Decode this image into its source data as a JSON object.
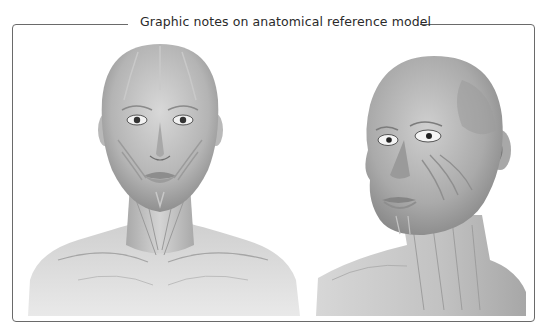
{
  "header": {
    "title": "Graphic notes on anatomical reference model"
  },
  "figures": [
    {
      "id": "front-view",
      "label": "Front view of female head, neck and shoulders with facial muscle overlay"
    },
    {
      "id": "three-quarter-view",
      "label": "Three-quarter view of female head and neck with facial muscle overlay"
    }
  ],
  "colors": {
    "frame": "#6a6a6a",
    "title": "#2a2a2a",
    "skin_light": "#e6e6e6",
    "skin_mid": "#bdbdbd",
    "skin_dark": "#8c8c8c"
  }
}
